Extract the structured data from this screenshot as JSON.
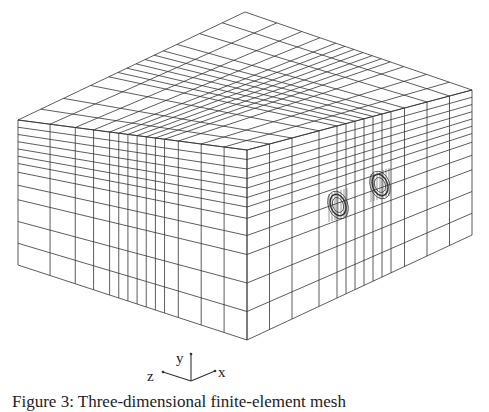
{
  "figure": {
    "caption": "Figure 3: Three-dimensional finite-element mesh",
    "axes": {
      "x": "x",
      "y": "y",
      "z": "z"
    },
    "vertices": {
      "top": [
        245,
        12
      ],
      "left": [
        18,
        120
      ],
      "right": [
        472,
        90
      ],
      "front": [
        247,
        150
      ],
      "left_bottom": [
        18,
        265
      ],
      "front_bottom": [
        247,
        340
      ],
      "right_bottom": [
        472,
        235
      ]
    },
    "left_face_u": [
      0,
      0.14,
      0.25,
      0.33,
      0.4,
      0.44,
      0.48,
      0.52,
      0.56,
      0.6,
      0.64,
      0.7,
      0.8,
      0.9,
      1
    ],
    "left_face_v": [
      0,
      0.05,
      0.1,
      0.15,
      0.2,
      0.25,
      0.3,
      0.36,
      0.45,
      0.55,
      0.7,
      0.85,
      1
    ],
    "right_face_u": [
      0,
      0.1,
      0.2,
      0.32,
      0.4,
      0.44,
      0.48,
      0.52,
      0.56,
      0.6,
      0.64,
      0.7,
      0.8,
      0.9,
      1
    ],
    "hole_centers": [
      [
        338,
        205
      ],
      [
        380,
        185
      ]
    ],
    "line_color": "#333333"
  }
}
